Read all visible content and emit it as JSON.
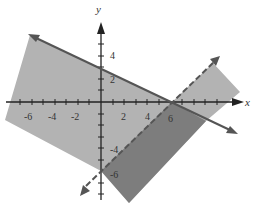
{
  "figure": {
    "axes": {
      "x_label": "x",
      "y_label": "y"
    },
    "x_tick_labels": [
      "-6",
      "-4",
      "-2",
      "2",
      "4",
      "6"
    ],
    "y_tick_labels": [
      "4",
      "2",
      "-4",
      "-6"
    ],
    "lines": [
      {
        "name": "solid-boundary",
        "equation": "y = 3 - x/2",
        "style": "solid",
        "x_intercept": 6,
        "y_intercept": 3
      },
      {
        "name": "dashed-boundary",
        "equation": "y = x - 6",
        "style": "dashed",
        "x_intercept": 6,
        "y_intercept": -6
      }
    ],
    "regions": [
      {
        "name": "light-shaded-region",
        "color": "#b3b3b3"
      },
      {
        "name": "dark-shaded-region-overlap",
        "color": "#7d7d7d"
      }
    ],
    "colors": {
      "axis": "#222222",
      "line": "#555555"
    }
  }
}
